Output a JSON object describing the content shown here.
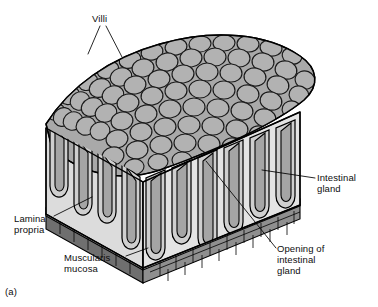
{
  "figure": {
    "caption": "(a)",
    "background_color": "#ffffff"
  },
  "labels": {
    "villi": "Villi",
    "intestinal_gland": "Intestinal\ngland",
    "opening_of_intestinal_gland": "Opening of\nintestinal\ngland",
    "lamina_propria": "Lamina\npropria",
    "muscularis_mucosa": "Muscularis\nmucosa"
  },
  "colors": {
    "outline": "#000000",
    "villi_surface": "#a9a9a9",
    "villi_surface_dark": "#9a9a9a",
    "front_face": "#e3e3e3",
    "right_face": "#d2d2d2",
    "left_face": "#dcdcdc",
    "crypt_lumen": "#b3b3b3",
    "muscularis_band": "#8f8f8f",
    "muscularis_band_dark": "#6f6f6f",
    "muscularis_edge": "#555555",
    "leader_line": "#000000",
    "text": "#0d0d0d"
  },
  "structures": [
    {
      "name": "villi",
      "description": "cobblestone rounded epithelial projections on top surface"
    },
    {
      "name": "intestinal-gland",
      "description": "tubular crypt extending downward from surface"
    },
    {
      "name": "opening-of-intestinal-gland",
      "description": "pore where crypt meets luminal surface"
    },
    {
      "name": "lamina-propria",
      "description": "pale connective tissue core beneath epithelium"
    },
    {
      "name": "muscularis-mucosa",
      "description": "dark banded smooth muscle layer at base"
    }
  ]
}
